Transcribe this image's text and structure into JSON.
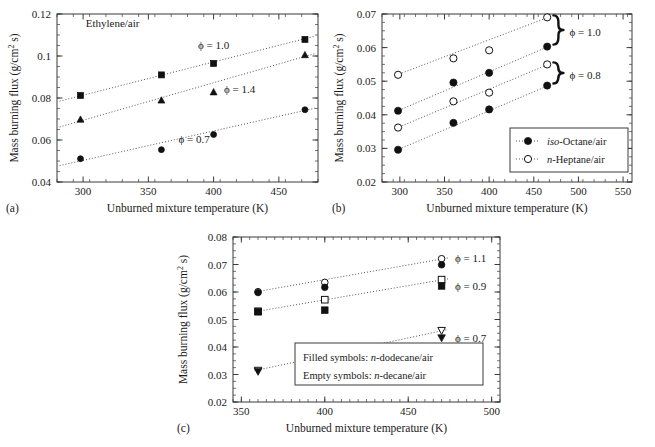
{
  "figure": {
    "panels": [
      "(a)",
      "(b)",
      "(c)"
    ],
    "common_xlabel": "Unburned mixture temperature (K)",
    "common_ylabel": "Mass burning flux (g/cm2 s)",
    "ylabel_parts": {
      "pre": "Mass burning flux (g/cm",
      "sup": "2",
      "post": " s)"
    }
  },
  "panel_a": {
    "letter": "(a)",
    "note": "Ethylene/air",
    "xlabel": "Unburned mixture temperature (K)",
    "xticks": [
      "300",
      "350",
      "400",
      "450"
    ],
    "yticks": [
      "0.04",
      "0.06",
      "0.08",
      "0.1",
      "0.12"
    ],
    "annotations": [
      {
        "text": "ϕ = 1.0",
        "x": 400,
        "y": 0.1035
      },
      {
        "text": "ϕ = 1.4",
        "x": 420,
        "y": 0.0825
      },
      {
        "text": "ϕ = 0.7",
        "x": 385,
        "y": 0.0585
      }
    ]
  },
  "panel_b": {
    "letter": "(b)",
    "xlabel": "Unburned mixture temperature (K)",
    "xticks": [
      "300",
      "350",
      "400",
      "450",
      "500",
      "550"
    ],
    "yticks": [
      "0.02",
      "0.03",
      "0.04",
      "0.05",
      "0.06",
      "0.07"
    ],
    "legend": [
      {
        "marker": "filled-circle",
        "label_italic": "iso",
        "label_rest": "-Octane/air"
      },
      {
        "marker": "open-circle",
        "label_italic": "n",
        "label_rest": "-Heptane/air"
      }
    ],
    "braces": [
      {
        "text": "ϕ = 1.0",
        "y_top": 0.069,
        "y_bot": 0.0603
      },
      {
        "text": "ϕ = 0.8",
        "y_top": 0.055,
        "y_bot": 0.0487
      }
    ]
  },
  "panel_c": {
    "letter": "(c)",
    "xlabel": "Unburned mixture temperature (K)",
    "xticks": [
      "350",
      "400",
      "450",
      "500"
    ],
    "yticks": [
      "0.02",
      "0.03",
      "0.04",
      "0.05",
      "0.06",
      "0.07",
      "0.08"
    ],
    "legend": [
      {
        "pre": "Filled symbols: ",
        "ital": "n",
        "post": "-dodecane/air"
      },
      {
        "pre": "Empty symbols: ",
        "ital": "n",
        "post": "-decane/air"
      }
    ],
    "annotations": [
      {
        "text": "ϕ = 1.1",
        "x": 478,
        "y": 0.0722
      },
      {
        "text": "ϕ = 0.9",
        "x": 478,
        "y": 0.0622
      },
      {
        "text": "ϕ = 0.7",
        "x": 478,
        "y": 0.0432
      }
    ]
  },
  "chart_data": [
    {
      "id": "a",
      "type": "scatter",
      "title": "Ethylene/air",
      "xlabel": "Unburned mixture temperature (K)",
      "ylabel": "Mass burning flux (g/cm2 s)",
      "xlim": [
        280,
        480
      ],
      "ylim": [
        0.04,
        0.12
      ],
      "xticks": [
        300,
        350,
        400,
        450
      ],
      "yticks": [
        0.04,
        0.06,
        0.08,
        0.1,
        0.12
      ],
      "grid": false,
      "legend_position": "inline-annotations",
      "series": [
        {
          "name": "ϕ = 1.0",
          "marker": "filled-square",
          "x": [
            298,
            360,
            400,
            470
          ],
          "y": [
            0.0812,
            0.091,
            0.0965,
            0.1079
          ],
          "fit": {
            "x": [
              282,
              478
            ],
            "y": [
              0.0785,
              0.1095
            ]
          }
        },
        {
          "name": "ϕ = 1.4",
          "marker": "filled-triangle",
          "x": [
            298,
            360,
            400,
            470
          ],
          "y": [
            0.0697,
            0.0788,
            0.0827,
            0.1004
          ],
          "fit": {
            "x": [
              282,
              478
            ],
            "y": [
              0.0662,
              0.1012
            ]
          }
        },
        {
          "name": "ϕ = 0.7",
          "marker": "filled-circle",
          "x": [
            298,
            360,
            400,
            470
          ],
          "y": [
            0.0511,
            0.0554,
            0.0626,
            0.0744
          ],
          "fit": {
            "x": [
              282,
              478
            ],
            "y": [
              0.0478,
              0.0752
            ]
          }
        }
      ]
    },
    {
      "id": "b",
      "type": "scatter",
      "title": "",
      "xlabel": "Unburned mixture temperature (K)",
      "ylabel": "Mass burning flux (g/cm2 s)",
      "xlim": [
        280,
        560
      ],
      "ylim": [
        0.02,
        0.07
      ],
      "xticks": [
        300,
        350,
        400,
        450,
        500,
        550
      ],
      "yticks": [
        0.02,
        0.03,
        0.04,
        0.05,
        0.06,
        0.07
      ],
      "grid": false,
      "legend_position": "lower-right",
      "series": [
        {
          "name": "n-Heptane/air ϕ = 1.0",
          "marker": "open-circle",
          "x": [
            298,
            360,
            400,
            465
          ],
          "y": [
            0.0519,
            0.0568,
            0.0592,
            0.069
          ],
          "fit": {
            "x": [
              296,
              468
            ],
            "y": [
              0.0518,
              0.0692
            ]
          }
        },
        {
          "name": "iso-Octane/air ϕ = 1.0",
          "marker": "filled-circle",
          "x": [
            298,
            360,
            400,
            465
          ],
          "y": [
            0.0412,
            0.0496,
            0.0525,
            0.0603
          ],
          "fit": {
            "x": [
              296,
              468
            ],
            "y": [
              0.041,
              0.0605
            ]
          }
        },
        {
          "name": "n-Heptane/air ϕ = 0.8",
          "marker": "open-circle",
          "x": [
            298,
            360,
            400,
            465
          ],
          "y": [
            0.0362,
            0.044,
            0.0466,
            0.055
          ],
          "fit": {
            "x": [
              296,
              468
            ],
            "y": [
              0.036,
              0.0552
            ]
          }
        },
        {
          "name": "iso-Octane/air ϕ = 0.8",
          "marker": "filled-circle",
          "x": [
            298,
            360,
            400,
            465
          ],
          "y": [
            0.0296,
            0.0376,
            0.0416,
            0.0487
          ],
          "fit": {
            "x": [
              296,
              468
            ],
            "y": [
              0.0294,
              0.0489
            ]
          }
        }
      ]
    },
    {
      "id": "c",
      "type": "scatter",
      "title": "",
      "xlabel": "Unburned mixture temperature (K)",
      "ylabel": "Mass burning flux (g/cm2 s)",
      "xlim": [
        345,
        505
      ],
      "ylim": [
        0.02,
        0.08
      ],
      "xticks": [
        350,
        400,
        450,
        500
      ],
      "yticks": [
        0.02,
        0.03,
        0.04,
        0.05,
        0.06,
        0.07,
        0.08
      ],
      "grid": false,
      "legend_position": "lower-right",
      "series": [
        {
          "name": "n-decane/air ϕ = 1.1",
          "marker": "open-circle",
          "x": [
            360,
            400,
            470
          ],
          "y": [
            0.0601,
            0.0635,
            0.0721
          ],
          "fit": {
            "x": [
              358,
              474
            ],
            "y": [
              0.06,
              0.0724
            ]
          }
        },
        {
          "name": "n-dodecane/air ϕ = 1.1",
          "marker": "filled-circle",
          "x": [
            360,
            400,
            470
          ],
          "y": [
            0.0598,
            0.0617,
            0.0699
          ]
        },
        {
          "name": "n-decane/air ϕ = 0.9",
          "marker": "open-square",
          "x": [
            360,
            400,
            470
          ],
          "y": [
            0.053,
            0.0572,
            0.0645
          ],
          "fit": {
            "x": [
              358,
              474
            ],
            "y": [
              0.0528,
              0.0648
            ]
          }
        },
        {
          "name": "n-dodecane/air ϕ = 0.9",
          "marker": "filled-square",
          "x": [
            360,
            400,
            470
          ],
          "y": [
            0.0528,
            0.0534,
            0.0622
          ]
        },
        {
          "name": "n-decane/air ϕ = 0.7",
          "marker": "open-triangle-down",
          "x": [
            360,
            400,
            470
          ],
          "y": [
            0.0316,
            0.0377,
            0.0461
          ],
          "fit": {
            "x": [
              358,
              474
            ],
            "y": [
              0.0314,
              0.0464
            ]
          }
        },
        {
          "name": "n-dodecane/air ϕ = 0.7",
          "marker": "filled-triangle-down",
          "x": [
            360,
            400,
            470
          ],
          "y": [
            0.0312,
            0.0353,
            0.0434
          ]
        }
      ]
    }
  ]
}
